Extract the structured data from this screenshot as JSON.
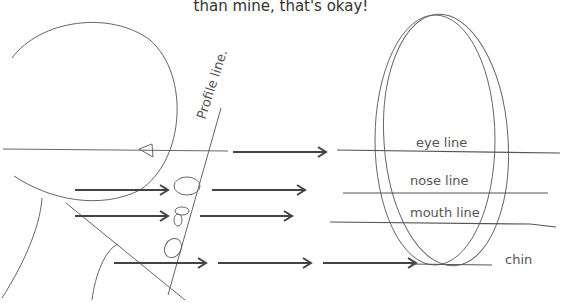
{
  "caption": "than mine, that's okay!",
  "labels": {
    "profile_line": "Profile line.",
    "eye_line": "eye line",
    "nose_line": "nose line",
    "mouth_line": "mouth line",
    "chin": "chin"
  },
  "colors": {
    "stroke": "#555555",
    "arrow": "#444444",
    "text": "#555555"
  }
}
